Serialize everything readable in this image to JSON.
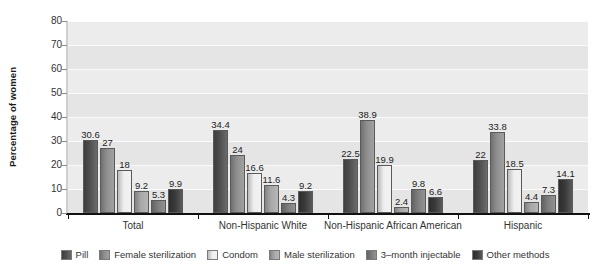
{
  "chart_data": {
    "type": "bar",
    "title": "",
    "xlabel": "",
    "ylabel": "Percentage of women",
    "ylim": [
      0,
      80
    ],
    "ytick_step": 10,
    "yticks": [
      80,
      70,
      60,
      50,
      40,
      30,
      20,
      10,
      0
    ],
    "grid": true,
    "legend_position": "bottom",
    "categories": [
      "Total",
      "Non-Hispanic White",
      "Non-Hispanic African American",
      "Hispanic"
    ],
    "series": [
      {
        "name": "Pill",
        "color": "#4f4f4f",
        "values": [
          30.6,
          34.4,
          22.5,
          22.0
        ]
      },
      {
        "name": "Female sterilization",
        "color": "#8f8f8f",
        "values": [
          27.0,
          24.0,
          38.9,
          33.8
        ]
      },
      {
        "name": "Condom",
        "color": "#efefef",
        "values": [
          18.0,
          16.6,
          19.9,
          18.5
        ]
      },
      {
        "name": "Male sterilization",
        "color": "#a8a8a8",
        "values": [
          9.2,
          11.6,
          2.4,
          4.4
        ]
      },
      {
        "name": "3–month injectable",
        "color": "#7d7d7d",
        "values": [
          5.3,
          4.3,
          9.8,
          7.3
        ]
      },
      {
        "name": "Other methods",
        "color": "#3a3a3a",
        "values": [
          9.9,
          9.2,
          6.6,
          14.1
        ]
      }
    ],
    "value_labels": {
      "Total": [
        "30.6",
        "27",
        "18",
        "9.2",
        "5.3",
        "9.9"
      ],
      "Non-Hispanic White": [
        "34.4",
        "24",
        "16.6",
        "11.6",
        "4.3",
        "9.2"
      ],
      "Non-Hispanic African American": [
        "22.5",
        "38.9",
        "19.9",
        "2.4",
        "9.8",
        "6.6"
      ],
      "Hispanic": [
        "22",
        "33.8",
        "18.5",
        "4.4",
        "7.3",
        "14.1"
      ]
    }
  },
  "style": {
    "plot_background": "#e9e9e9",
    "gridline_color": "#fbfbfb",
    "axis_color": "#111111",
    "text_color": "#333333"
  }
}
